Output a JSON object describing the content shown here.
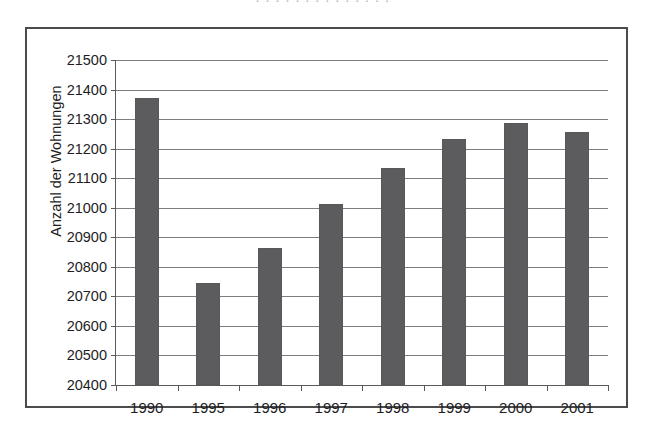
{
  "page": {
    "cut_off_top_text": "· ·   · ·  · · ·     ·  ·  · ·   ·  · ·"
  },
  "chart_data": {
    "type": "bar",
    "title": "",
    "xlabel": "",
    "ylabel": "Anzahl der Wohnungen",
    "categories": [
      "1990",
      "1995",
      "1996",
      "1997",
      "1998",
      "1999",
      "2000",
      "2001"
    ],
    "values": [
      21371,
      20746,
      20864,
      21013,
      21136,
      21232,
      21287,
      21258
    ],
    "ylim": [
      20400,
      21500
    ],
    "ytick_step": 100,
    "ytick_labels": [
      "21500",
      "21400",
      "21300",
      "21200",
      "21100",
      "21000",
      "20900",
      "20800",
      "20700",
      "20600",
      "20500",
      "20400"
    ],
    "grid": true,
    "legend": "none",
    "bar_color": "#5c5c5e",
    "axis_color": "#5a5a5c",
    "grid_color": "#7d7d80",
    "frame_color": "#4c4c4e",
    "background": "#ffffff"
  }
}
